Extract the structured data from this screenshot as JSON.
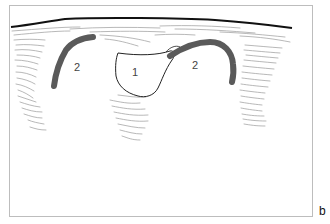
{
  "figure": {
    "panel_label": "b",
    "labels": [
      {
        "id": "region-1",
        "text": "1",
        "x": 132,
        "y": 67
      },
      {
        "id": "region-2-left",
        "text": "2",
        "x": 74,
        "y": 62
      },
      {
        "id": "region-2-right",
        "text": "2",
        "x": 192,
        "y": 60
      }
    ],
    "colors": {
      "frame": "#bdbdbd",
      "surface_line": "#111111",
      "hatching": "#9a9a9a",
      "arc_fill": "#5a5a5a",
      "outline": "#222222"
    }
  }
}
